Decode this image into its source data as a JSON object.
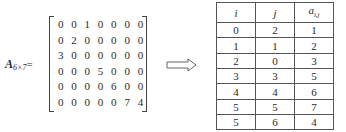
{
  "matrix": {
    "name": "A",
    "dims": "6×7",
    "equals": "=",
    "rows": [
      [
        "0",
        "0",
        "1",
        "0",
        "0",
        "0",
        "0"
      ],
      [
        "0",
        "2",
        "0",
        "0",
        "0",
        "0",
        "0"
      ],
      [
        "3",
        "0",
        "0",
        "0",
        "0",
        "0",
        "0"
      ],
      [
        "0",
        "0",
        "0",
        "5",
        "0",
        "0",
        "0"
      ],
      [
        "0",
        "0",
        "0",
        "0",
        "6",
        "0",
        "0"
      ],
      [
        "0",
        "0",
        "0",
        "0",
        "0",
        "7",
        "4"
      ]
    ]
  },
  "arrow": {
    "icon": "double-right-arrow-icon"
  },
  "table": {
    "headers": {
      "i": "i",
      "j": "j",
      "a": "a",
      "a_sub": "i,j"
    },
    "rows": [
      [
        "0",
        "2",
        "1"
      ],
      [
        "1",
        "1",
        "2"
      ],
      [
        "2",
        "0",
        "3"
      ],
      [
        "3",
        "3",
        "5"
      ],
      [
        "4",
        "4",
        "6"
      ],
      [
        "5",
        "5",
        "7"
      ],
      [
        "5",
        "6",
        "4"
      ]
    ]
  }
}
